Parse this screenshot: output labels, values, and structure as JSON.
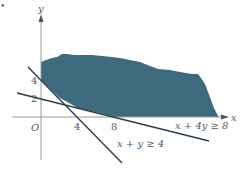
{
  "diagram": {
    "type": "linear-inequalities-region",
    "axes": {
      "x_label": "x",
      "y_label": "y",
      "origin_label": "O",
      "x_ticks": [
        "4",
        "8"
      ],
      "y_ticks": [
        "2",
        "4"
      ]
    },
    "lines": [
      {
        "id": "line1",
        "label": "x + y ≥ 4",
        "equation": "x + y = 4",
        "x_intercept": 4,
        "y_intercept": 4
      },
      {
        "id": "line2",
        "label": "x + 4y ≥ 8",
        "equation": "x + 4y = 8",
        "x_intercept": 8,
        "y_intercept": 2
      }
    ],
    "region": {
      "description": "feasible region above both lines in first quadrant",
      "fill_color": "#3d6b7d"
    },
    "colors": {
      "axis": "#999999",
      "line": "#2a3f4a",
      "text": "#555555"
    },
    "corner_marker": "•"
  }
}
